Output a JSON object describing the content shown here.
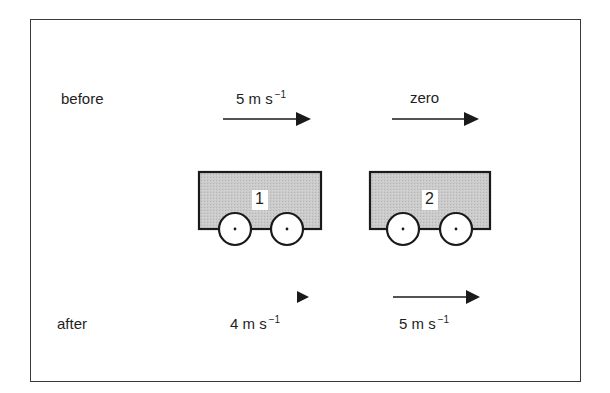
{
  "diagram": {
    "rows": {
      "before": {
        "label": "before"
      },
      "after": {
        "label": "after"
      }
    },
    "trolleys": [
      {
        "id": "1",
        "label": "1",
        "fill": "#c8c8c8"
      },
      {
        "id": "2",
        "label": "2",
        "fill": "#c8c8c8"
      }
    ],
    "velocities": {
      "before": [
        {
          "trolley": "1",
          "value": "5",
          "unit": "m s",
          "exponent": "−1"
        },
        {
          "trolley": "2",
          "text": "zero"
        }
      ],
      "after": [
        {
          "trolley": "1",
          "value": "4",
          "unit": "m s",
          "exponent": "−1"
        },
        {
          "trolley": "2",
          "value": "5",
          "unit": "m s",
          "exponent": "−1"
        }
      ]
    },
    "colors": {
      "stroke": "#1a1a1a",
      "trolley_fill": "#c8c8c8",
      "background": "#ffffff"
    }
  }
}
